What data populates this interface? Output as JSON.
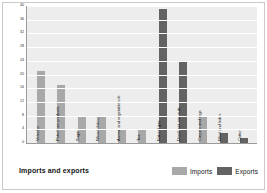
{
  "figure": {
    "footer_title": "Imports and exports"
  },
  "legend": {
    "position": "bottom-right",
    "items": [
      {
        "label": "Imports",
        "color": "#a8a8a8"
      },
      {
        "label": "Exports",
        "color": "#636363"
      }
    ]
  },
  "chart_data": {
    "type": "bar",
    "title": "Imports and exports",
    "xlabel": "",
    "ylabel": "Percentage of total",
    "ylim": [
      0,
      40
    ],
    "yticks": [
      0,
      4,
      8,
      12,
      16,
      20,
      24,
      28,
      32,
      36,
      40
    ],
    "grid": true,
    "orientation": "vertical",
    "categories": [
      "Vehicles",
      "Petroleum products",
      "Sugar",
      "Woven fabrics",
      "Animal and vegetable oils",
      "Tea",
      "Natural gas",
      "Dried fruit and nuts",
      "Carpets and rugs",
      "Wool and hides",
      "Cotton"
    ],
    "values": [
      21,
      17,
      8,
      8,
      4,
      4,
      39,
      24,
      8,
      3,
      1.5
    ],
    "series_of": [
      "Imports",
      "Imports",
      "Imports",
      "Imports",
      "Imports",
      "Imports",
      "Exports",
      "Exports",
      "Imports",
      "Exports",
      "Exports"
    ],
    "colors": {
      "imports": "#a8a8a8",
      "exports": "#636363",
      "plot_background": "#ededed",
      "gridline": "#ffffff",
      "axis": "#9a9a9a"
    }
  }
}
